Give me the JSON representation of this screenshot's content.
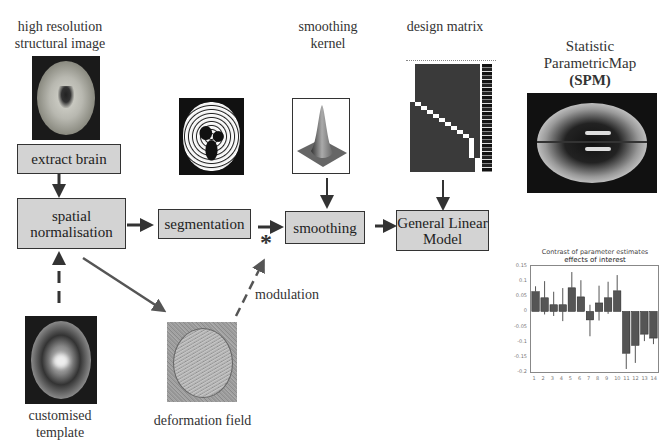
{
  "labels": {
    "structural_image": [
      "high resolution",
      "structural image"
    ],
    "smoothing_kernel": [
      "smoothing",
      "kernel"
    ],
    "design_matrix": "design matrix",
    "spm": [
      "Statistic",
      "ParametricMap",
      "(SPM)"
    ],
    "customised_template": [
      "customised",
      "template"
    ],
    "deformation_field": "deformation field",
    "modulation": "modulation",
    "asterisk": "*"
  },
  "boxes": {
    "extract_brain": "extract brain",
    "spatial_normalisation": [
      "spatial",
      "normalisation"
    ],
    "segmentation": "segmentation",
    "smoothing": "smoothing",
    "glm": [
      "General Linear",
      "Model"
    ]
  },
  "colors": {
    "box_fill": "#d3d3d3",
    "box_border": "#333333",
    "arrow": "#333333",
    "bar_fill": "#555555"
  },
  "chart_data": {
    "type": "bar",
    "title": "Contrast of parameter estimates",
    "subtitle": "effects of interest",
    "categories": [
      "1",
      "2",
      "3",
      "4",
      "5",
      "6",
      "7",
      "8",
      "9",
      "10",
      "11",
      "12",
      "13",
      "14"
    ],
    "values": [
      0.065,
      0.045,
      0.022,
      0.022,
      0.078,
      0.048,
      -0.028,
      0.028,
      0.045,
      0.068,
      -0.138,
      -0.112,
      -0.075,
      -0.088
    ],
    "error_upper": [
      0.083,
      0.1,
      0.065,
      0.077,
      0.13,
      0.103,
      0.022,
      0.085,
      0.098,
      0.12,
      -0.138,
      -0.112,
      -0.075,
      -0.088
    ],
    "error_lower": [
      0.065,
      -0.01,
      -0.015,
      -0.032,
      0.078,
      0.048,
      -0.082,
      -0.03,
      -0.008,
      0.068,
      -0.19,
      -0.17,
      -0.098,
      -0.108
    ],
    "yticks": [
      "0.15",
      "0.1",
      "0.05",
      "0",
      "-0.05",
      "-0.1",
      "-0.15",
      "-0.2"
    ],
    "ylim": [
      -0.2,
      0.15
    ],
    "xlabel": "",
    "ylabel": "",
    "grid": false
  }
}
